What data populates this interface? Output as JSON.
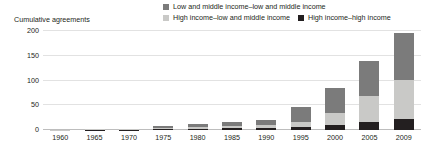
{
  "chart_data": {
    "type": "bar",
    "stacked": true,
    "title": "",
    "ylabel": "Cumulative agreements",
    "xlabel": "",
    "ylim": [
      0,
      200
    ],
    "yticks": [
      0,
      50,
      100,
      150,
      200
    ],
    "grid": true,
    "legend_position": "top-right",
    "categories": [
      "1960",
      "1965",
      "1970",
      "1975",
      "1980",
      "1985",
      "1990",
      "1995",
      "2000",
      "2005",
      "2009"
    ],
    "series": [
      {
        "name": "High income–high income",
        "color": "#231f20",
        "values": [
          0,
          1,
          1,
          2,
          3,
          4,
          5,
          6,
          10,
          17,
          22
        ]
      },
      {
        "name": "High income–low and middle income",
        "color": "#c9c9c7",
        "values": [
          1,
          1,
          2,
          3,
          4,
          5,
          6,
          10,
          25,
          51,
          79
        ]
      },
      {
        "name": "Low and middle income–low and middle income",
        "color": "#7b7b7b",
        "values": [
          0,
          0,
          0,
          4,
          6,
          8,
          10,
          30,
          50,
          72,
          95
        ]
      }
    ],
    "totals": [
      1,
      2,
      3,
      9,
      13,
      17,
      21,
      46,
      85,
      140,
      196
    ]
  },
  "legend": {
    "rows": [
      [
        {
          "label": "Low and middle income–low and middle income",
          "swatch": "#7b7b7b",
          "icon": "legend-swatch-icon"
        }
      ],
      [
        {
          "label": "High income–low and middle income",
          "swatch": "#c9c9c7",
          "icon": "legend-swatch-icon"
        },
        {
          "label": "High income–high income",
          "swatch": "#231f20",
          "icon": "legend-swatch-icon"
        }
      ]
    ]
  },
  "colors": {
    "gridline": "#e2e2e2",
    "axis": "#bdbdbd",
    "text": "#231f20",
    "background": "#ffffff"
  }
}
